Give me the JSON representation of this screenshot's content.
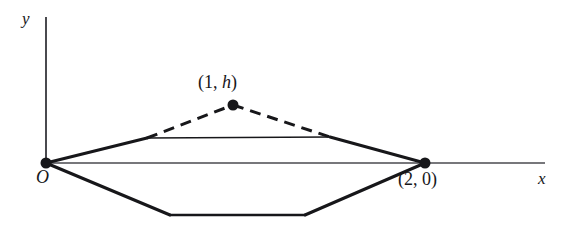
{
  "figure": {
    "background_color": "#ffffff",
    "stroke_color": "#17171a",
    "axis_color": "#4a4a4f",
    "width": 566,
    "height": 230
  },
  "axes": {
    "y_axis": {
      "label": "y",
      "x": 46,
      "y_top": 17,
      "y_bottom": 163
    },
    "x_axis": {
      "label": "x",
      "y": 163,
      "x_left": 46,
      "x_right": 545
    }
  },
  "points": [
    {
      "name": "origin",
      "label": "O",
      "x": 46,
      "y": 163,
      "marked": true
    },
    {
      "name": "apex",
      "label": "(1, h)",
      "x": 233,
      "y": 105,
      "marked": true
    },
    {
      "name": "right-intercept",
      "label": "(2, 0)",
      "x": 425,
      "y": 163,
      "marked": true
    }
  ],
  "shapes": {
    "upper_trapezoid": {
      "name": "upper-solid-trapezoid",
      "style": "solid",
      "vertices": [
        [
          46,
          163
        ],
        [
          147,
          138
        ],
        [
          330,
          137
        ],
        [
          425,
          163
        ]
      ]
    },
    "upper_top_edge": {
      "name": "upper-top-thin-edge",
      "style": "thin-solid",
      "vertices": [
        [
          147,
          138
        ],
        [
          330,
          137
        ]
      ]
    },
    "dashed_triangle": {
      "name": "dashed-apex-triangle",
      "style": "dashed",
      "vertices": [
        [
          147,
          138
        ],
        [
          233,
          105
        ],
        [
          330,
          137
        ]
      ]
    },
    "lower_trapezoid": {
      "name": "lower-solid-trapezoid",
      "style": "solid",
      "vertices": [
        [
          46,
          163
        ],
        [
          170,
          215
        ],
        [
          305,
          215
        ],
        [
          425,
          163
        ]
      ]
    }
  },
  "chart_data": {
    "type": "line",
    "title": "",
    "xlabel": "x",
    "ylabel": "y",
    "grid": false,
    "legend": null,
    "annotations": [
      "O",
      "(1, h)",
      "(2, 0)"
    ],
    "series": [
      {
        "name": "upper-trapezoid-outline",
        "style": "solid",
        "points": [
          [
            46,
            163
          ],
          [
            147,
            138
          ],
          [
            330,
            137
          ],
          [
            425,
            163
          ]
        ]
      },
      {
        "name": "dashed-apex-triangle",
        "style": "dashed",
        "points": [
          [
            147,
            138
          ],
          [
            233,
            105
          ],
          [
            330,
            137
          ]
        ]
      },
      {
        "name": "lower-trapezoid-outline",
        "style": "solid",
        "points": [
          [
            46,
            163
          ],
          [
            170,
            215
          ],
          [
            305,
            215
          ],
          [
            425,
            163
          ]
        ]
      }
    ]
  }
}
